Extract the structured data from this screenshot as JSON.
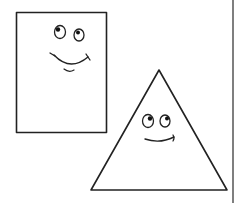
{
  "illustration": {
    "description": "Cartoon of a smiling square and a smiling triangle overlapping",
    "shapes": [
      {
        "name": "square",
        "expression": "smiling",
        "eyes_looking": "up-left"
      },
      {
        "name": "triangle",
        "expression": "smiling",
        "eyes_looking": "up-right"
      }
    ]
  },
  "colors": {
    "background": "#ffffff",
    "stroke": "#222222",
    "pupil": "#111111",
    "border_line": "#555555"
  }
}
